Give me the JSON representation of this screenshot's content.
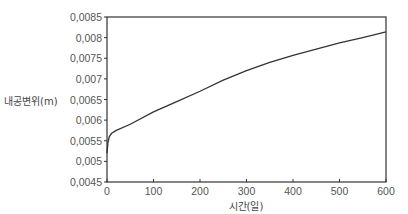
{
  "chart_data": {
    "type": "line",
    "title": "",
    "xlabel": "시간(일)",
    "ylabel": "내공변위(m)",
    "xlim": [
      0,
      600
    ],
    "ylim": [
      0.0045,
      0.0085
    ],
    "x_ticks": [
      0,
      100,
      200,
      300,
      400,
      500,
      600
    ],
    "y_ticks": [
      0.0045,
      0.005,
      0.0055,
      0.006,
      0.0065,
      0.007,
      0.0075,
      0.008,
      0.0085
    ],
    "x_tick_labels": [
      "0",
      "100",
      "200",
      "300",
      "400",
      "500",
      "600"
    ],
    "y_tick_labels": [
      "0,0045",
      "0,005",
      "0,0055",
      "0,006",
      "0,0065",
      "0,007",
      "0,0075",
      "0,008",
      "0,0085"
    ],
    "grid": false,
    "legend": null,
    "series": [
      {
        "name": "내공변위",
        "x": [
          0,
          2,
          5,
          10,
          20,
          50,
          100,
          150,
          200,
          250,
          300,
          350,
          400,
          450,
          500,
          550,
          600
        ],
        "values": [
          0.0052,
          0.00545,
          0.0056,
          0.00568,
          0.00575,
          0.0059,
          0.0062,
          0.00645,
          0.0067,
          0.00697,
          0.0072,
          0.0074,
          0.00757,
          0.00772,
          0.00787,
          0.008,
          0.00814
        ]
      }
    ]
  },
  "colors": {
    "line": "#333333",
    "axis": "#333333",
    "text": "#555555"
  }
}
